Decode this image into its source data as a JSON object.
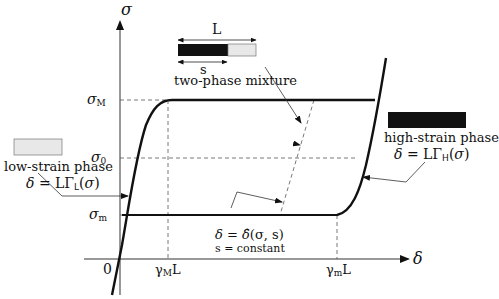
{
  "diagram": {
    "type": "stress-elongation phase diagram",
    "axes": {
      "y_label": "σ",
      "x_label": "δ",
      "origin_label": "0"
    },
    "y_ticks": {
      "sigma_M": {
        "base": "σ",
        "sub": "M"
      },
      "sigma_0": {
        "base": "σ",
        "sub": "0"
      },
      "sigma_m": {
        "base": "σ",
        "sub": "m"
      }
    },
    "x_ticks": {
      "gamma_M_L": {
        "base": "γ",
        "sub": "M",
        "suffix": "L"
      },
      "gamma_m_L": {
        "base": "γ",
        "sub": "m",
        "suffix": "L"
      }
    },
    "low_phase": {
      "title": "low-strain phase",
      "formula_lhs": "δ = LΓ",
      "formula_sub": "L",
      "formula_rhs": "(σ)",
      "swatch_color": "#e8e8e8"
    },
    "high_phase": {
      "title": "high-strain phase",
      "formula_lhs": "δ = LΓ",
      "formula_sub": "H",
      "formula_rhs": "(σ)",
      "swatch_color": "#111111"
    },
    "mixture": {
      "title": "two-phase mixture",
      "length_label": "L",
      "s_label": "s"
    },
    "constant_s": {
      "formula_lhs": "δ = ",
      "formula_hat": "δ̂",
      "formula_rhs": "(σ, s)",
      "note": "s = constant"
    }
  }
}
